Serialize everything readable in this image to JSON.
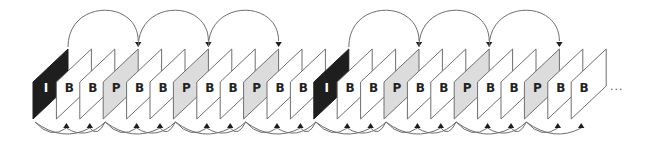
{
  "diagram": {
    "title": "",
    "frames": [
      "I",
      "B",
      "B",
      "P",
      "B",
      "B",
      "P",
      "B",
      "B",
      "P",
      "B",
      "B",
      "I",
      "B",
      "B",
      "P",
      "B",
      "B",
      "P",
      "B",
      "B",
      "P",
      "B",
      "B"
    ],
    "ellipsis": "...",
    "colors": {
      "I": "#1e1e1e",
      "P": "#dcdcdc",
      "B": "#ffffff",
      "stroke": "#6e6e6e",
      "arrow": "#1e1e1e",
      "label_dark": "#222222",
      "label_light": "#ffffff"
    },
    "forward_prediction_arcs": [
      {
        "from": 0,
        "to": 3
      },
      {
        "from": 3,
        "to": 6
      },
      {
        "from": 6,
        "to": 9
      },
      {
        "from": 12,
        "to": 15
      },
      {
        "from": 15,
        "to": 18
      },
      {
        "from": 18,
        "to": 21
      }
    ],
    "bidirectional_anchor_groups": [
      {
        "prev": 0,
        "next": 3,
        "b": [
          1,
          2
        ]
      },
      {
        "prev": 3,
        "next": 6,
        "b": [
          4,
          5
        ]
      },
      {
        "prev": 6,
        "next": 9,
        "b": [
          7,
          8
        ]
      },
      {
        "prev": 9,
        "next": 12,
        "b": [
          10,
          11
        ]
      },
      {
        "prev": 12,
        "next": 15,
        "b": [
          13,
          14
        ]
      },
      {
        "prev": 15,
        "next": 18,
        "b": [
          16,
          17
        ]
      },
      {
        "prev": 18,
        "next": 21,
        "b": [
          19,
          20
        ]
      },
      {
        "prev": 21,
        "next": null,
        "b": [
          22,
          23
        ]
      }
    ]
  }
}
